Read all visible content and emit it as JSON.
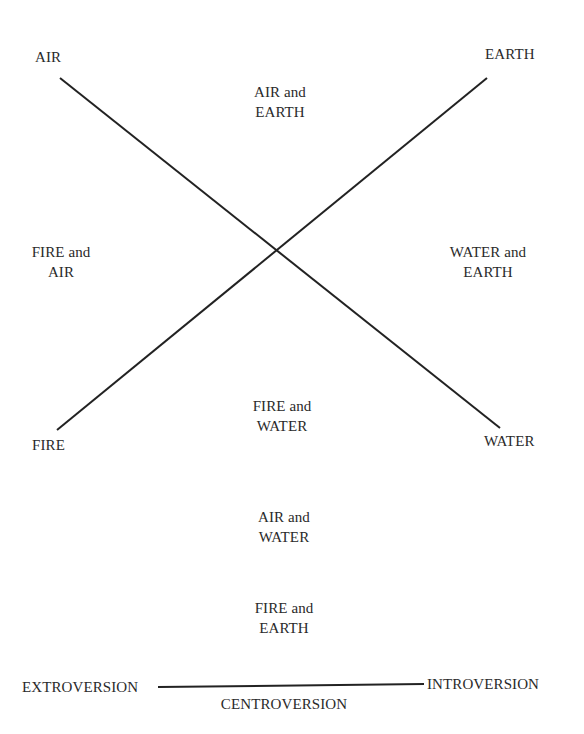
{
  "diagram": {
    "type": "element-cross",
    "corners": {
      "top_left": "AIR",
      "top_right": "EARTH",
      "bottom_left": "FIRE",
      "bottom_right": "WATER"
    },
    "quadrants": {
      "top": {
        "line1": "AIR and",
        "line2": "EARTH"
      },
      "left": {
        "line1": "FIRE and",
        "line2": "AIR"
      },
      "right": {
        "line1": "WATER and",
        "line2": "EARTH"
      },
      "bottom": {
        "line1": "FIRE and",
        "line2": "WATER"
      }
    },
    "extra_pairs": [
      {
        "line1": "AIR and",
        "line2": "WATER"
      },
      {
        "line1": "FIRE and",
        "line2": "EARTH"
      }
    ],
    "axis": {
      "left": "EXTROVERSION",
      "right": "INTROVERSION",
      "center": "CENTROVERSION"
    },
    "lines": [
      {
        "name": "air-water-diagonal",
        "from": [
          60,
          78
        ],
        "to": [
          500,
          428
        ]
      },
      {
        "name": "fire-earth-diagonal",
        "from": [
          57,
          430
        ],
        "to": [
          487,
          78
        ]
      },
      {
        "name": "extroversion-introversion-axis",
        "from": [
          158,
          687
        ],
        "to": [
          424,
          684
        ]
      }
    ],
    "line_color": "#222222"
  }
}
